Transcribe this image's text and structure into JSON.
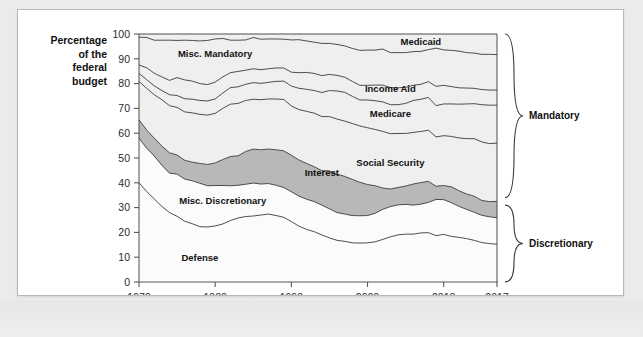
{
  "figure": {
    "axis_caption_lines": [
      "Percentage",
      "of the",
      "federal",
      "budget"
    ],
    "y_ticks": [
      0,
      10,
      20,
      30,
      40,
      50,
      60,
      70,
      80,
      90,
      100
    ],
    "x_ticks": [
      1970,
      1980,
      1990,
      2000,
      2010,
      2017
    ],
    "group_brackets": [
      {
        "label": "Mandatory",
        "y_from": 34,
        "y_to": 100
      },
      {
        "label": "Discretionary",
        "y_from": 0,
        "y_to": 31
      }
    ],
    "colors": {
      "plot_background": "#efefef",
      "band_light": "#efefef",
      "band_white": "#fbfbfb",
      "band_interest": "#b8b8b8",
      "line": "#3a3a3a",
      "card": "#ffffff",
      "page": "#eceaea"
    }
  },
  "chart_data": {
    "type": "area",
    "title": "",
    "subtitle": "",
    "xlabel": "",
    "ylabel": "Percentage of the federal budget",
    "xlim": [
      1970,
      2017
    ],
    "ylim": [
      0,
      100
    ],
    "grid": false,
    "legend_position": "inline-annotations",
    "stacking": "percent",
    "note": "Stacked percentage-of-budget composition; bottom-to-top order is Defense, Misc. Discretionary, Interest, Social Security, Medicare, Income Aid, Misc. Mandatory, Medicaid.",
    "x": [
      1970,
      1971,
      1972,
      1973,
      1974,
      1975,
      1976,
      1977,
      1978,
      1979,
      1980,
      1981,
      1982,
      1983,
      1984,
      1985,
      1986,
      1987,
      1988,
      1989,
      1990,
      1991,
      1992,
      1993,
      1994,
      1995,
      1996,
      1997,
      1998,
      1999,
      2000,
      2001,
      2002,
      2003,
      2004,
      2005,
      2006,
      2007,
      2008,
      2009,
      2010,
      2011,
      2012,
      2013,
      2014,
      2015,
      2016,
      2017
    ],
    "series": [
      {
        "name": "Defense",
        "label": "Defense",
        "fill": "#fbfbfb",
        "label_at": {
          "x": 1978,
          "y": 10
        },
        "values": [
          40.0,
          36.5,
          33.5,
          30.5,
          28.0,
          26.5,
          24.5,
          23.5,
          22.3,
          22.2,
          22.6,
          23.4,
          24.8,
          25.8,
          26.4,
          26.6,
          27.0,
          27.4,
          26.8,
          26.1,
          24.4,
          22.5,
          21.2,
          20.3,
          19.0,
          17.8,
          16.8,
          16.4,
          15.8,
          15.7,
          15.8,
          16.2,
          17.0,
          18.2,
          19.0,
          19.3,
          19.3,
          19.8,
          19.9,
          18.7,
          19.2,
          18.4,
          18.0,
          17.5,
          16.8,
          15.9,
          15.5,
          15.2
        ]
      },
      {
        "name": "Misc. Discretionary",
        "label": "Misc. Discretionary",
        "fill": "#fbfbfb",
        "label_at": {
          "x": 1981,
          "y": 33
        },
        "values": [
          18.0,
          17.5,
          17.3,
          16.6,
          15.9,
          17.0,
          17.0,
          17.3,
          17.5,
          16.6,
          16.3,
          15.5,
          14.0,
          13.2,
          13.0,
          13.3,
          12.5,
          12.3,
          12.2,
          12.0,
          12.0,
          12.1,
          12.2,
          12.1,
          12.0,
          11.7,
          11.2,
          11.0,
          11.0,
          11.0,
          11.0,
          11.5,
          12.0,
          12.2,
          12.1,
          12.0,
          11.7,
          11.6,
          12.2,
          14.6,
          14.0,
          13.6,
          12.5,
          11.8,
          11.3,
          11.0,
          10.8,
          10.7
        ]
      },
      {
        "name": "Interest",
        "label": "Interest",
        "fill": "#b8b8b8",
        "label_at": {
          "x": 1994,
          "y": 44
        },
        "values": [
          7.4,
          7.3,
          7.2,
          7.7,
          8.2,
          7.7,
          7.6,
          7.5,
          8.0,
          8.6,
          9.1,
          10.5,
          11.8,
          11.9,
          13.2,
          13.7,
          13.8,
          13.9,
          14.3,
          14.8,
          14.7,
          14.6,
          14.4,
          14.1,
          13.9,
          15.3,
          15.5,
          15.2,
          14.6,
          13.5,
          12.5,
          11.1,
          8.5,
          7.1,
          7.0,
          7.4,
          8.5,
          8.7,
          8.5,
          5.3,
          5.7,
          6.4,
          6.3,
          6.2,
          6.5,
          6.0,
          6.1,
          6.6
        ]
      },
      {
        "name": "Social Security",
        "label": "Social Security",
        "fill": "#efefef",
        "label_at": {
          "x": 2003,
          "y": 48
        },
        "values": [
          15.5,
          16.8,
          17.5,
          18.7,
          19.0,
          19.2,
          19.5,
          19.9,
          19.8,
          19.9,
          20.0,
          20.6,
          21.1,
          21.1,
          20.6,
          20.1,
          20.2,
          20.2,
          20.5,
          20.7,
          19.9,
          20.3,
          21.0,
          21.6,
          21.8,
          21.9,
          22.2,
          22.3,
          22.5,
          22.7,
          22.9,
          22.7,
          22.6,
          22.3,
          21.8,
          21.2,
          20.8,
          20.6,
          20.6,
          19.9,
          20.1,
          20.3,
          21.3,
          22.3,
          23.2,
          23.6,
          23.4,
          23.5
        ]
      },
      {
        "name": "Medicare",
        "label": "Medicare",
        "fill": "#efefef",
        "label_at": {
          "x": 2003,
          "y": 68
        },
        "values": [
          3.2,
          3.5,
          3.6,
          3.7,
          4.4,
          4.8,
          5.3,
          5.5,
          5.6,
          5.7,
          5.8,
          6.2,
          6.7,
          6.7,
          6.5,
          6.7,
          6.6,
          6.7,
          7.1,
          7.4,
          8.0,
          8.6,
          8.9,
          9.1,
          9.7,
          10.5,
          11.3,
          11.6,
          11.0,
          10.5,
          11.2,
          11.6,
          11.8,
          11.7,
          11.6,
          12.1,
          12.9,
          13.0,
          13.2,
          12.6,
          12.8,
          13.1,
          13.6,
          14.0,
          14.1,
          15.0,
          15.5,
          15.3
        ]
      },
      {
        "name": "Income Aid",
        "label": "Income Aid",
        "fill": "#efefef",
        "label_at": {
          "x": 2003,
          "y": 78
        },
        "values": [
          3.4,
          4.8,
          5.1,
          5.5,
          5.8,
          7.2,
          7.6,
          7.3,
          6.8,
          6.6,
          6.8,
          6.5,
          6.0,
          6.2,
          5.7,
          5.6,
          5.5,
          5.5,
          5.4,
          5.3,
          5.6,
          6.3,
          6.8,
          6.9,
          6.8,
          6.5,
          6.3,
          6.1,
          6.0,
          5.9,
          5.9,
          6.3,
          6.7,
          6.9,
          6.8,
          6.5,
          6.1,
          6.0,
          6.4,
          7.8,
          7.5,
          7.0,
          6.6,
          6.4,
          6.2,
          6.1,
          6.1,
          6.1
        ]
      },
      {
        "name": "Misc. Mandatory",
        "label": "Misc. Mandatory",
        "fill": "#efefef",
        "label_at": {
          "x": 1980,
          "y": 92
        },
        "values": [
          11.2,
          12.2,
          13.3,
          14.8,
          16.2,
          15.0,
          16.0,
          16.4,
          17.2,
          17.8,
          17.4,
          15.5,
          13.1,
          12.6,
          12.2,
          12.6,
          12.3,
          12.0,
          11.7,
          11.6,
          13.0,
          13.3,
          12.7,
          12.6,
          13.0,
          12.5,
          12.5,
          12.6,
          13.3,
          14.1,
          14.2,
          14.1,
          14.4,
          14.1,
          14.2,
          14.0,
          13.6,
          13.3,
          12.9,
          15.4,
          14.3,
          14.6,
          14.8,
          14.3,
          14.2,
          14.2,
          14.4,
          14.3
        ]
      },
      {
        "name": "Medicaid",
        "label": "Medicaid",
        "fill": "#efefef",
        "label_at": {
          "x": 2007,
          "y": 97
        },
        "values": [
          1.3,
          1.4,
          2.5,
          2.5,
          2.5,
          2.6,
          2.5,
          2.6,
          2.8,
          2.6,
          2.0,
          1.8,
          2.5,
          2.5,
          2.4,
          1.4,
          2.1,
          2.0,
          2.0,
          2.1,
          2.4,
          2.3,
          2.8,
          3.3,
          3.8,
          3.8,
          4.2,
          4.8,
          5.8,
          6.6,
          6.5,
          6.5,
          6.0,
          7.5,
          7.5,
          7.5,
          7.1,
          7.0,
          6.3,
          5.7,
          6.4,
          6.6,
          6.9,
          7.5,
          7.7,
          8.2,
          8.2,
          8.3
        ]
      }
    ]
  }
}
